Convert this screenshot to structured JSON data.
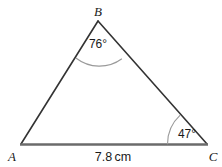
{
  "figure": {
    "type": "triangle-diagram",
    "background_color": "#ffffff",
    "stroke_color": "#333333",
    "base_stroke_color": "#666666",
    "arc_color": "#999999",
    "text_color": "#1a1a1a",
    "vertices": [
      {
        "name": "A",
        "label": "A",
        "x": 21,
        "y": 144
      },
      {
        "name": "B",
        "label": "B",
        "x": 98,
        "y": 21
      },
      {
        "name": "C",
        "label": "C",
        "x": 207,
        "y": 144
      }
    ],
    "angles": [
      {
        "at": "B",
        "label": "76°",
        "value": 76,
        "unit": "degrees"
      },
      {
        "at": "C",
        "label": "47°",
        "value": 47,
        "unit": "degrees"
      }
    ],
    "sides": [
      {
        "from": "A",
        "to": "C",
        "label": "7.8 cm",
        "value": 7.8,
        "unit": "cm"
      }
    ]
  }
}
